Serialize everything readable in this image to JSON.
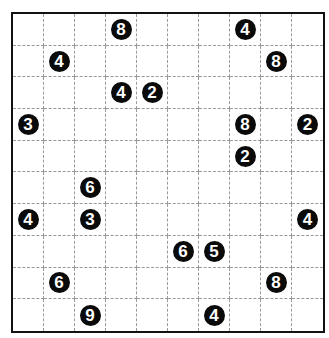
{
  "puzzle": {
    "rows": 10,
    "cols": 10,
    "colors": {
      "border": "#111111",
      "grid_line": "#9a9a9a",
      "clue_fill": "#0a0a0a",
      "clue_text": "#ffffff",
      "cell_bg": "#ffffff"
    },
    "clues": [
      {
        "row": 0,
        "col": 3,
        "value": "8"
      },
      {
        "row": 0,
        "col": 7,
        "value": "4"
      },
      {
        "row": 1,
        "col": 1,
        "value": "4"
      },
      {
        "row": 1,
        "col": 8,
        "value": "8"
      },
      {
        "row": 2,
        "col": 3,
        "value": "4"
      },
      {
        "row": 2,
        "col": 4,
        "value": "2"
      },
      {
        "row": 3,
        "col": 0,
        "value": "3"
      },
      {
        "row": 3,
        "col": 7,
        "value": "8"
      },
      {
        "row": 3,
        "col": 9,
        "value": "2"
      },
      {
        "row": 4,
        "col": 7,
        "value": "2"
      },
      {
        "row": 5,
        "col": 2,
        "value": "6"
      },
      {
        "row": 6,
        "col": 0,
        "value": "4"
      },
      {
        "row": 6,
        "col": 2,
        "value": "3"
      },
      {
        "row": 6,
        "col": 9,
        "value": "4"
      },
      {
        "row": 7,
        "col": 5,
        "value": "6"
      },
      {
        "row": 7,
        "col": 6,
        "value": "5"
      },
      {
        "row": 8,
        "col": 1,
        "value": "6"
      },
      {
        "row": 8,
        "col": 8,
        "value": "8"
      },
      {
        "row": 9,
        "col": 2,
        "value": "9"
      },
      {
        "row": 9,
        "col": 6,
        "value": "4"
      }
    ]
  }
}
